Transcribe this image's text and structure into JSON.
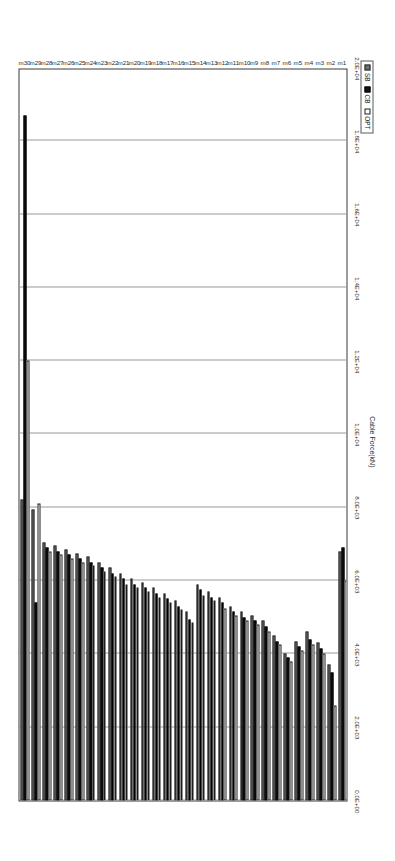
{
  "chart_data": {
    "type": "bar",
    "orientation": "horizontal",
    "title": "",
    "xlabel": "",
    "ylabel": "Cable Force(kN)",
    "grid": true,
    "legend_position": "bottom-right",
    "axis_range": [
      0,
      20000
    ],
    "axis_ticks": [
      "0.0E+00",
      "2.0E+03",
      "4.0E+03",
      "6.0E+03",
      "8.0E+03",
      "1.0E+04",
      "1.2E+04",
      "1.4E+04",
      "1.6E+04",
      "1.8E+04",
      "2.0E+04"
    ],
    "axis_tick_values": [
      0,
      2000,
      4000,
      6000,
      8000,
      10000,
      12000,
      14000,
      16000,
      18000,
      20000
    ],
    "categories": [
      "m1",
      "m2",
      "m3",
      "m4",
      "m5",
      "m6",
      "m7",
      "m8",
      "m9",
      "m10",
      "m11",
      "m12",
      "m13",
      "m14",
      "m15",
      "m16",
      "m17",
      "m18",
      "m19",
      "m20",
      "m21",
      "m22",
      "m23",
      "m24",
      "m25",
      "m26",
      "m27",
      "m28",
      "m29",
      "m30"
    ],
    "series": [
      {
        "name": "SB",
        "color": "#6f6f6f",
        "values": [
          6800,
          3700,
          4300,
          4600,
          4350,
          4000,
          4500,
          4900,
          5050,
          5150,
          5300,
          5550,
          5700,
          5900,
          5150,
          5450,
          5650,
          5800,
          5950,
          6050,
          6200,
          6350,
          6500,
          6650,
          6750,
          6850,
          6950,
          7050,
          7950,
          8200
        ]
      },
      {
        "name": "CB",
        "color": "#141414",
        "values": [
          6900,
          3500,
          4150,
          4400,
          4200,
          3900,
          4350,
          4750,
          4900,
          5000,
          5150,
          5400,
          5550,
          5750,
          4950,
          5300,
          5500,
          5650,
          5800,
          5900,
          6050,
          6200,
          6350,
          6500,
          6600,
          6700,
          6800,
          6900,
          5400,
          18700
        ]
      },
      {
        "name": "OPT",
        "color": "#ffffff",
        "values": [
          6000,
          2600,
          4000,
          4250,
          4100,
          3800,
          4250,
          4600,
          4800,
          4900,
          5050,
          5250,
          5450,
          5600,
          4850,
          5200,
          5400,
          5550,
          5700,
          5800,
          5900,
          6100,
          6250,
          6400,
          6500,
          6600,
          6700,
          6800,
          8100,
          12000
        ]
      }
    ]
  },
  "legend": {
    "items": [
      {
        "label": "SB",
        "swatch": "sb"
      },
      {
        "label": "CB",
        "swatch": "cb"
      },
      {
        "label": "OPT",
        "swatch": "opt"
      }
    ]
  }
}
